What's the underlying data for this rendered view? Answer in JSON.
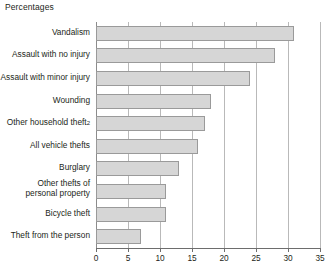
{
  "axis_title": "Percentages",
  "chart_data": {
    "type": "bar",
    "orientation": "horizontal",
    "title": "",
    "subtitle": "",
    "xlabel": "Percentages",
    "ylabel": "",
    "xlim": [
      0,
      35
    ],
    "grid": true,
    "legend": null,
    "xticks": [
      "0",
      "5",
      "10",
      "15",
      "20",
      "25",
      "30",
      "35"
    ],
    "xtick_values": [
      0,
      5,
      10,
      15,
      20,
      25,
      30,
      35
    ],
    "categories": [
      "Vandalism",
      "Assault with no injury",
      "Assault with minor injury",
      "Wounding",
      "Other household theft",
      "All vehicle thefts",
      "Burglary",
      "Other thefts of personal property",
      "Bicycle theft",
      "Theft from the person"
    ],
    "values": [
      31,
      28,
      24,
      18,
      17,
      16,
      13,
      11,
      11,
      7
    ],
    "annotations": [
      {
        "category": "Other household theft",
        "footnote_marker": "2"
      }
    ],
    "colors": {
      "bar_fill": "#d6d6d6",
      "bar_border": "#9a9a9a",
      "gridline": "#b9b9b9",
      "axis": "#6d6d6d",
      "text": "#231f20"
    }
  },
  "category_rows": [
    {
      "label": "Vandalism",
      "marker": "",
      "line2": ""
    },
    {
      "label": "Assault with no injury",
      "marker": "",
      "line2": ""
    },
    {
      "label": "Assault with minor injury",
      "marker": "",
      "line2": ""
    },
    {
      "label": "Wounding",
      "marker": "",
      "line2": ""
    },
    {
      "label": "Other household theft",
      "marker": "2",
      "line2": ""
    },
    {
      "label": "All vehicle thefts",
      "marker": "",
      "line2": ""
    },
    {
      "label": "Burglary",
      "marker": "",
      "line2": ""
    },
    {
      "label": "Other thefts of",
      "marker": "",
      "line2": "personal property"
    },
    {
      "label": "Bicycle theft",
      "marker": "",
      "line2": ""
    },
    {
      "label": "Theft from the person",
      "marker": "",
      "line2": ""
    }
  ]
}
